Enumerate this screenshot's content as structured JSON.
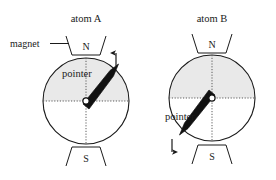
{
  "figure": {
    "background": "#ffffff",
    "ink": "#1a1a1a",
    "dial_fill_top": "#e9e9e9",
    "dial_fill_bottom": "#ffffff"
  },
  "labels": {
    "magnet": "magnet"
  },
  "atoms": [
    {
      "id": "atom-a",
      "title": "atom A",
      "pointer_label": "pointer",
      "north_pole": "N",
      "south_pole": "S",
      "field_arrow": "up",
      "field_arrow_glyph": "↑",
      "pointer_direction_deg": 45,
      "dial_shaded_half": "top"
    },
    {
      "id": "atom-b",
      "title": "atom B",
      "pointer_label": "pointer",
      "north_pole": "N",
      "south_pole": "S",
      "field_arrow": "down",
      "field_arrow_glyph": "↓",
      "pointer_direction_deg": 225,
      "dial_shaded_half": "top"
    }
  ]
}
